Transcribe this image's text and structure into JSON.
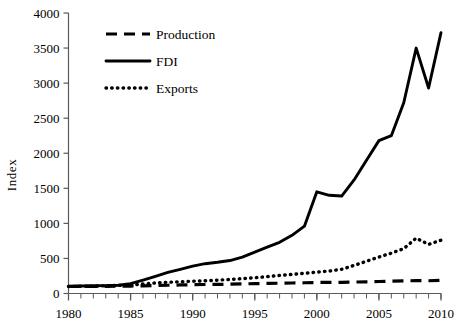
{
  "chart_data": {
    "type": "line",
    "title": "",
    "xlabel": "",
    "ylabel": "Index",
    "xlim": [
      1980,
      2010
    ],
    "ylim": [
      0,
      4000
    ],
    "ytick_step": 500,
    "xtick_major_step": 5,
    "xtick_minor_step": 1,
    "grid": false,
    "legend_position": "top-left-inside",
    "x": [
      1980,
      1981,
      1982,
      1983,
      1984,
      1985,
      1986,
      1987,
      1988,
      1989,
      1990,
      1991,
      1992,
      1993,
      1994,
      1995,
      1996,
      1997,
      1998,
      1999,
      2000,
      2001,
      2002,
      2003,
      2004,
      2005,
      2006,
      2007,
      2008,
      2009,
      2010
    ],
    "xticks": [
      1980,
      1985,
      1990,
      1995,
      2000,
      2005,
      2010
    ],
    "xtick_labels": [
      "1980",
      "1985",
      "1990",
      "1995",
      "2000",
      "2005",
      "2010"
    ],
    "yticks": [
      0,
      500,
      1000,
      1500,
      2000,
      2500,
      3000,
      3500,
      4000
    ],
    "ytick_labels": [
      "0",
      "500",
      "1000",
      "1500",
      "2000",
      "2500",
      "3000",
      "3500",
      "4000"
    ],
    "series": [
      {
        "name": "Production",
        "style": "dashed",
        "color": "#000000",
        "values": [
          100,
          101,
          100,
          102,
          104,
          106,
          110,
          114,
          118,
          122,
          126,
          128,
          130,
          133,
          137,
          141,
          144,
          147,
          150,
          153,
          157,
          158,
          160,
          163,
          167,
          171,
          175,
          180,
          184,
          182,
          187
        ]
      },
      {
        "name": "FDI",
        "style": "solid",
        "color": "#000000",
        "values": [
          105,
          108,
          110,
          112,
          118,
          140,
          190,
          245,
          300,
          345,
          390,
          425,
          445,
          470,
          520,
          590,
          660,
          730,
          830,
          960,
          1450,
          1400,
          1390,
          1620,
          1900,
          2180,
          2250,
          2720,
          3500,
          2930,
          3720
        ]
      },
      {
        "name": "Exports",
        "style": "dotted",
        "color": "#000000",
        "values": [
          100,
          103,
          106,
          110,
          115,
          120,
          135,
          150,
          160,
          168,
          175,
          182,
          190,
          200,
          212,
          225,
          240,
          258,
          272,
          288,
          305,
          320,
          345,
          400,
          460,
          520,
          575,
          640,
          790,
          700,
          760
        ]
      }
    ]
  },
  "legend": {
    "entries": [
      {
        "label": "Production",
        "style": "dashed"
      },
      {
        "label": "FDI",
        "style": "solid"
      },
      {
        "label": "Exports",
        "style": "dotted"
      }
    ]
  },
  "axes": {
    "y_axis_title": "Index"
  }
}
